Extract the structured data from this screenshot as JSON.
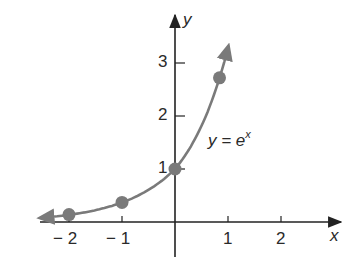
{
  "chart_data": {
    "type": "line",
    "title": "",
    "function_label": "y = e^x",
    "xlabel": "x",
    "ylabel": "y",
    "x_ticks": [
      -2,
      -1,
      1,
      2
    ],
    "x_tick_labels": [
      "− 2",
      "− 1",
      "1",
      "2"
    ],
    "y_ticks": [
      1,
      2,
      3
    ],
    "y_tick_labels": [
      "1",
      "2",
      "3"
    ],
    "xlim": [
      -2.5,
      3.2
    ],
    "ylim": [
      -0.8,
      3.9
    ],
    "grid": false,
    "legend": "none",
    "series": [
      {
        "name": "y = e^x",
        "x": [
          -2,
          -1,
          0,
          1
        ],
        "values": [
          0.14,
          0.37,
          1.0,
          2.72
        ],
        "markers": true,
        "curve_arrows": "both ends"
      }
    ],
    "colors": {
      "curve": "#7a7a7a",
      "axes": "#222222",
      "markers": "#7a7a7a"
    }
  },
  "labels": {
    "x_axis": "x",
    "y_axis": "y",
    "equation_main": "y = e",
    "equation_sup": "x"
  }
}
